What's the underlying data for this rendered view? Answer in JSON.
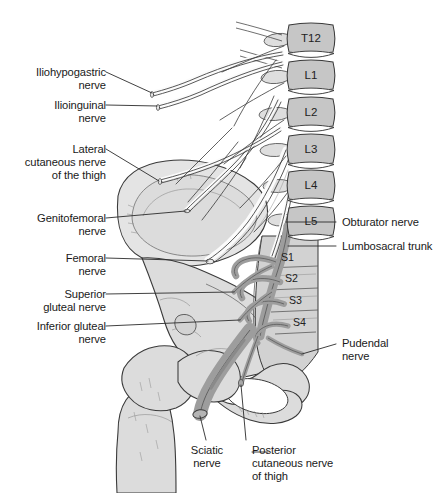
{
  "figure": {
    "background_color": "#ffffff",
    "text_color": "#1a1a1a",
    "leader_line_color": "#2b2b2b",
    "outline_color": "#3a3a3a",
    "palette": {
      "bone_light": "#e4e4e4",
      "bone_mid": "#cccccc",
      "vertebra_body": "#c6c6c6",
      "sacrum": "#d2d2d2",
      "nerve_light": "#fbfbfb",
      "nerve_dark": "#9d9d9d",
      "nerve_dark_shade": "#8a8a8a",
      "femur": "#dcdcdc"
    }
  },
  "left_labels": [
    {
      "id": "iliohypogastric-nerve",
      "text": "Iliohypogastric\nnerve",
      "x": 14,
      "y": 66,
      "width": 92
    },
    {
      "id": "ilioinguinal-nerve",
      "text": "Ilioinguinal\nnerve",
      "x": 14,
      "y": 99,
      "width": 92
    },
    {
      "id": "lateral-cutaneous-nerve-of-the-thigh",
      "text": "Lateral\ncutaneous nerve\nof the thigh",
      "x": 8,
      "y": 143,
      "width": 98
    },
    {
      "id": "genitofemoral-nerve",
      "text": "Genitofemoral\nnerve",
      "x": 14,
      "y": 212,
      "width": 92
    },
    {
      "id": "femoral-nerve",
      "text": "Femoral\nnerve",
      "x": 30,
      "y": 252,
      "width": 76
    },
    {
      "id": "superior-gluteal-nerve",
      "text": "Superior\ngluteal nerve",
      "x": 20,
      "y": 288,
      "width": 86
    },
    {
      "id": "inferior-gluteal-nerve",
      "text": "Inferior gluteal\nnerve",
      "x": 14,
      "y": 320,
      "width": 92
    }
  ],
  "right_labels": [
    {
      "id": "obturator-nerve",
      "text": "Obturator nerve",
      "x": 342,
      "y": 218
    },
    {
      "id": "lumbosacral-trunk",
      "text": "Lumbosacral trunk",
      "x": 342,
      "y": 242
    },
    {
      "id": "pudendal-nerve",
      "text": "Pudendal\nnerve",
      "x": 342,
      "y": 338
    }
  ],
  "bottom_labels": [
    {
      "id": "sciatic-nerve",
      "text": "Sciatic\nnerve",
      "x": 182,
      "y": 445,
      "width": 54,
      "align": "center"
    },
    {
      "id": "posterior-cutaneous-nerve-of-thigh",
      "text": "Posterior\ncutaneous nerve\nof thigh",
      "x": 252,
      "y": 445,
      "width": 100,
      "align": "left"
    }
  ],
  "vertebrae": [
    {
      "id": "T12",
      "label": "T12",
      "x": 289,
      "y": 25,
      "w": 44,
      "h": 27
    },
    {
      "id": "L1",
      "label": "L1",
      "x": 289,
      "y": 62,
      "w": 44,
      "h": 27
    },
    {
      "id": "L2",
      "label": "L2",
      "x": 289,
      "y": 99,
      "w": 44,
      "h": 27
    },
    {
      "id": "L3",
      "label": "L3",
      "x": 289,
      "y": 136,
      "w": 44,
      "h": 27
    },
    {
      "id": "L4",
      "label": "L4",
      "x": 289,
      "y": 172,
      "w": 44,
      "h": 27
    },
    {
      "id": "L5",
      "label": "L5",
      "x": 289,
      "y": 208,
      "w": 44,
      "h": 27
    }
  ],
  "sacral_segments": [
    {
      "id": "S1",
      "label": "S1",
      "x": 281,
      "y": 257
    },
    {
      "id": "S2",
      "label": "S2",
      "x": 285,
      "y": 277
    },
    {
      "id": "S3",
      "label": "S3",
      "x": 289,
      "y": 299
    },
    {
      "id": "S4",
      "label": "S4",
      "x": 293,
      "y": 321
    }
  ]
}
